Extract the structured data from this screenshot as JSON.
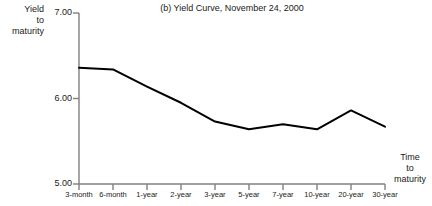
{
  "chart_data": {
    "type": "line",
    "title": "(b) Yield Curve, November 24, 2000",
    "ylabel": "Yield to maturity",
    "ylabel_lines": [
      "Yield",
      "to",
      "maturity"
    ],
    "xlabel": "Time to maturity",
    "xlabel_lines": [
      "Time",
      "to",
      "maturity"
    ],
    "categories": [
      "3-month",
      "6-month",
      "1-year",
      "2-year",
      "3-year",
      "5-year",
      "7-year",
      "10-year",
      "20-year",
      "30-year"
    ],
    "values": [
      6.36,
      6.34,
      6.14,
      5.95,
      5.73,
      5.64,
      5.7,
      5.64,
      5.86,
      5.67
    ],
    "ylim": [
      5.0,
      7.0
    ],
    "ytick_values": [
      7.0,
      6.0,
      5.0
    ],
    "ytick_labels": [
      "7.00",
      "6.00",
      "5.00"
    ],
    "grid": false,
    "legend": "none",
    "series_name": "Yield curve",
    "line_color": "#000000",
    "axis_color": "#808080",
    "text_color": "#1a1a1a"
  }
}
